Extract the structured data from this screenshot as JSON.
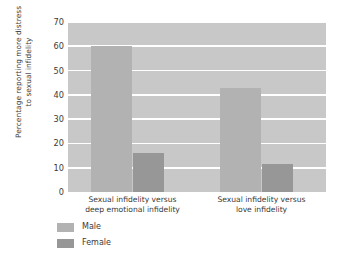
{
  "chart_data": {
    "type": "bar",
    "title": "",
    "subtitle": "",
    "xlabel": "",
    "ylabel": "Percentage reporting more distress\nto sexual infidelity",
    "ylabel_lines": [
      "Percentage reporting more distress",
      "to sexual infidelity"
    ],
    "ylim": [
      0,
      70
    ],
    "ytick_values": [
      0,
      10,
      20,
      30,
      40,
      50,
      60,
      70
    ],
    "ytick_labels": [
      "0",
      "10",
      "20",
      "30",
      "40",
      "50",
      "60",
      "70"
    ],
    "grid": true,
    "grid_axis": "y",
    "grid_color": "#ffffff",
    "plot_background": "#c8c8c8",
    "legend_position": "below-left",
    "categories": [
      "Sexual infidelity versus deep emotional infidelity",
      "Sexual infidelity versus love infidelity"
    ],
    "category_label_lines": [
      [
        "Sexual infidelity versus",
        "deep emotional infidelity"
      ],
      [
        "Sexual infidelity versus",
        "love infidelity"
      ]
    ],
    "series": [
      {
        "name": "Male",
        "color": "#b2b2b2",
        "values": [
          60,
          43
        ]
      },
      {
        "name": "Female",
        "color": "#979797",
        "values": [
          16,
          11.5
        ]
      }
    ]
  }
}
